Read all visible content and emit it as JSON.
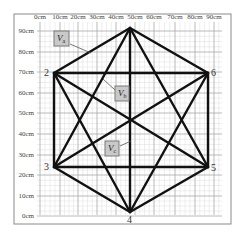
{
  "diagram": {
    "frame": {
      "x": 14,
      "y": 14,
      "w": 217,
      "h": 210
    },
    "plot": {
      "x0": 37,
      "x1": 222,
      "y_top": 22,
      "y_bottom": 215
    },
    "x_axis": {
      "labels": [
        "0cm",
        "10cm",
        "20cm",
        "30cm",
        "40cm",
        "50cm",
        "60cm",
        "70cm",
        "80cm",
        "90cm"
      ],
      "positions": [
        40,
        60,
        78,
        97,
        116,
        135,
        154,
        175,
        195,
        214
      ],
      "label_y": 19
    },
    "y_axis": {
      "labels": [
        "90cm",
        "80cm",
        "70cm",
        "60cm",
        "50cm",
        "40cm",
        "30cm",
        "20cm",
        "10cm",
        "0cm"
      ],
      "positions": [
        31,
        52,
        72,
        93,
        113,
        134,
        155,
        175,
        196,
        216
      ],
      "label_x": 34
    },
    "vertices": [
      {
        "id": "1",
        "label": "",
        "x": 130,
        "y": 28
      },
      {
        "id": "2",
        "label": "2",
        "x": 54,
        "y": 73,
        "lx": 44,
        "ly": 76
      },
      {
        "id": "3",
        "label": "3",
        "x": 54,
        "y": 167,
        "lx": 44,
        "ly": 170
      },
      {
        "id": "4",
        "label": "4",
        "x": 130,
        "y": 212,
        "lx": 127,
        "ly": 223
      },
      {
        "id": "5",
        "label": "5",
        "x": 208,
        "y": 167,
        "lx": 211,
        "ly": 171
      },
      {
        "id": "6",
        "label": "6",
        "x": 208,
        "y": 73,
        "lx": 211,
        "ly": 76
      }
    ],
    "edges": [
      [
        "1",
        "2"
      ],
      [
        "1",
        "3"
      ],
      [
        "1",
        "4"
      ],
      [
        "1",
        "5"
      ],
      [
        "1",
        "6"
      ],
      [
        "2",
        "3"
      ],
      [
        "2",
        "4"
      ],
      [
        "2",
        "5"
      ],
      [
        "2",
        "6"
      ],
      [
        "3",
        "4"
      ],
      [
        "3",
        "5"
      ],
      [
        "3",
        "6"
      ],
      [
        "4",
        "5"
      ],
      [
        "4",
        "6"
      ],
      [
        "5",
        "6"
      ]
    ],
    "callouts": [
      {
        "name": "Va",
        "main": "V",
        "sub": "a",
        "box": {
          "x": 54,
          "y": 31,
          "w": 15,
          "h": 15
        },
        "leader": [
          70,
          44,
          91,
          53
        ]
      },
      {
        "name": "Vb",
        "main": "V",
        "sub": "b",
        "box": {
          "x": 115,
          "y": 86,
          "w": 14,
          "h": 15
        },
        "leader": [
          115,
          90,
          103,
          79
        ]
      },
      {
        "name": "Vc",
        "main": "V",
        "sub": "c",
        "box": {
          "x": 105,
          "y": 141,
          "w": 14,
          "h": 15
        },
        "leader": [
          120,
          146,
          131,
          141
        ]
      }
    ]
  }
}
